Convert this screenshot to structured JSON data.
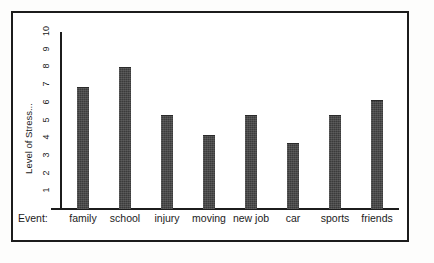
{
  "chart_data": {
    "type": "bar",
    "title": "",
    "subtitle": "",
    "xlabel": "Event:",
    "ylabel": "Level of Stress...",
    "categories": [
      "family",
      "school",
      "injury",
      "moving",
      "new job",
      "car",
      "sports",
      "friends"
    ],
    "values": [
      6.9,
      8.0,
      5.3,
      4.2,
      5.3,
      3.75,
      5.3,
      6.15
    ],
    "series": [
      {
        "name": "Level of Stress",
        "values": [
          6.9,
          8.0,
          5.3,
          4.2,
          5.3,
          3.75,
          5.3,
          6.15
        ]
      }
    ],
    "ylim": [
      0,
      10
    ],
    "y_ticks": [
      "1",
      "2",
      "3",
      "4",
      "5",
      "6",
      "7",
      "8",
      "9",
      "10"
    ],
    "y_tick_values": [
      1,
      2,
      3,
      4,
      5,
      6,
      7,
      8,
      9,
      10
    ],
    "grid": false,
    "legend": false,
    "legend_position": "none",
    "bar_color": "#3b3b3b",
    "axis_color": "#1c1c1c",
    "background_color": "#ffffff",
    "frame_color": "#1c1c1c"
  }
}
